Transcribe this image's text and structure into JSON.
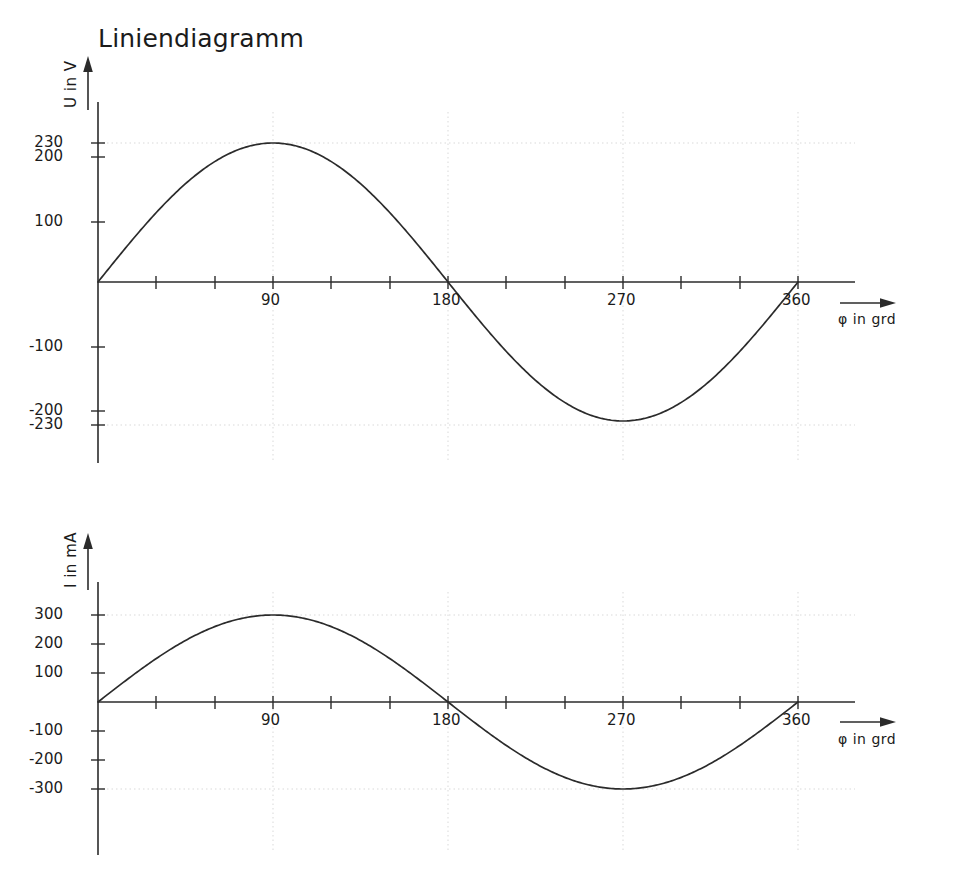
{
  "title": "Liniendiagramm",
  "charts": [
    {
      "id": "voltage",
      "ylabel": "U in V",
      "xlabel": "φ in grd",
      "ytick_labels": [
        "230",
        "200",
        "100",
        "-100",
        "-200",
        "-230"
      ],
      "xtick_labels": [
        "90",
        "180",
        "270",
        "360"
      ]
    },
    {
      "id": "current",
      "ylabel": "I in mA",
      "xlabel": "φ in grd",
      "ytick_labels": [
        "300",
        "200",
        "100",
        "-100",
        "-200",
        "-300"
      ],
      "xtick_labels": [
        "90",
        "180",
        "270",
        "360"
      ]
    }
  ],
  "chart_data": [
    {
      "type": "line",
      "title": "Liniendiagramm",
      "series_name": "U",
      "xlabel": "φ in grd",
      "ylabel": "U in V",
      "xlim": [
        0,
        360
      ],
      "ylim": [
        -280,
        280
      ],
      "grid": true,
      "legend": "none",
      "amplitude": 230,
      "unit": "V",
      "x": [
        0,
        30,
        60,
        90,
        120,
        150,
        180,
        210,
        240,
        270,
        300,
        330,
        360
      ],
      "y": [
        0,
        115,
        199.2,
        230,
        199.2,
        115,
        0,
        -115,
        -199.2,
        -230,
        -199.2,
        -115,
        0
      ],
      "yticks": [
        230,
        200,
        100,
        0,
        -100,
        -200,
        -230
      ],
      "ytick_labels": [
        "230",
        "200",
        "100",
        "",
        "-100",
        "-200",
        "-230"
      ],
      "xticks": [
        0,
        30,
        60,
        90,
        120,
        150,
        180,
        210,
        240,
        270,
        300,
        330,
        360
      ],
      "xtick_labels": [
        "",
        "",
        "",
        "90",
        "",
        "",
        "180",
        "",
        "",
        "270",
        "",
        "",
        "360"
      ],
      "gridlines_y": [
        230,
        -230
      ],
      "gridlines_x": [
        90,
        180,
        270,
        360
      ]
    },
    {
      "type": "line",
      "series_name": "I",
      "xlabel": "φ in grd",
      "ylabel": "I in mA",
      "xlim": [
        0,
        360
      ],
      "ylim": [
        -340,
        340
      ],
      "grid": true,
      "legend": "none",
      "amplitude": 300,
      "unit": "mA",
      "x": [
        0,
        30,
        60,
        90,
        120,
        150,
        180,
        210,
        240,
        270,
        300,
        330,
        360
      ],
      "y": [
        0,
        150,
        259.8,
        300,
        259.8,
        150,
        0,
        -150,
        -259.8,
        -300,
        -259.8,
        -150,
        0
      ],
      "yticks": [
        300,
        200,
        100,
        0,
        -100,
        -200,
        -300
      ],
      "ytick_labels": [
        "300",
        "200",
        "100",
        "",
        "-100",
        "-200",
        "-300"
      ],
      "xticks": [
        0,
        30,
        60,
        90,
        120,
        150,
        180,
        210,
        240,
        270,
        300,
        330,
        360
      ],
      "xtick_labels": [
        "",
        "",
        "",
        "90",
        "",
        "",
        "180",
        "",
        "",
        "270",
        "",
        "",
        "360"
      ],
      "gridlines_y": [
        300,
        -300
      ],
      "gridlines_x": [
        90,
        180,
        270,
        360
      ]
    }
  ],
  "colors": {
    "curve": "#2b2b2b",
    "axis": "#2b2b2b",
    "grid": "#d9d9d9",
    "text": "#1b1b1b",
    "background": "#ffffff"
  }
}
